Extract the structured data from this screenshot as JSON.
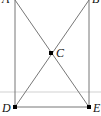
{
  "diagram": {
    "points": [
      {
        "label": "A",
        "x": 15,
        "y": 0
      },
      {
        "label": "B",
        "x": 89,
        "y": 0
      },
      {
        "label": "C",
        "x": 51,
        "y": 53
      },
      {
        "label": "D",
        "x": 15,
        "y": 107
      },
      {
        "label": "E",
        "x": 89,
        "y": 107
      }
    ],
    "segments": [
      "AD",
      "BE",
      "DE",
      "AE",
      "BD"
    ],
    "colors": {
      "line": "#777777",
      "point": "#000000",
      "rule": "#d9d9d9"
    }
  }
}
